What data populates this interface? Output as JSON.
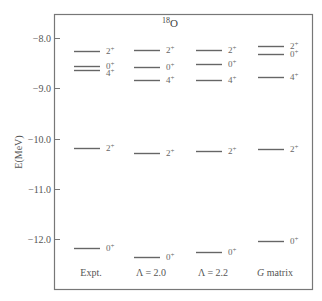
{
  "chart_data": {
    "type": "level-diagram",
    "title": "18O",
    "title_parts": {
      "mass": "18",
      "element": "O"
    },
    "ylabel": "E(MeV)",
    "ylim": [
      -12.98,
      -7.52
    ],
    "yticks": [
      -8.0,
      -9.0,
      -10.0,
      -11.0,
      -12.0
    ],
    "ytick_labels": [
      "-8.0",
      "-9.0",
      "-10.0",
      "-11.0",
      "-12.0"
    ],
    "grid": false,
    "columns": [
      {
        "label": "Expt.",
        "levels": [
          {
            "spin": "2+",
            "energy": -8.26
          },
          {
            "spin": "0+",
            "energy": -8.56
          },
          {
            "spin": "4+",
            "energy": -8.64
          },
          {
            "spin": "2+",
            "energy": -10.19
          },
          {
            "spin": "0+",
            "energy": -12.18
          }
        ]
      },
      {
        "label": "Λ = 2.0",
        "levels": [
          {
            "spin": "2+",
            "energy": -8.24
          },
          {
            "spin": "0+",
            "energy": -8.58
          },
          {
            "spin": "4+",
            "energy": -8.84
          },
          {
            "spin": "2+",
            "energy": -10.29
          },
          {
            "spin": "0+",
            "energy": -12.35
          }
        ]
      },
      {
        "label": "Λ = 2.2",
        "levels": [
          {
            "spin": "2+",
            "energy": -8.24
          },
          {
            "spin": "0+",
            "energy": -8.52
          },
          {
            "spin": "4+",
            "energy": -8.84
          },
          {
            "spin": "2+",
            "energy": -10.25
          },
          {
            "spin": "0+",
            "energy": -12.25
          }
        ]
      },
      {
        "label": "G matrix",
        "label_parts": {
          "italic": "G",
          "rest": "matrix"
        },
        "levels": [
          {
            "spin": "2+",
            "energy": -8.15
          },
          {
            "spin": "0+",
            "energy": -8.32
          },
          {
            "spin": "4+",
            "energy": -8.78
          },
          {
            "spin": "2+",
            "energy": -10.21
          },
          {
            "spin": "0+",
            "energy": -12.04
          }
        ]
      }
    ]
  }
}
